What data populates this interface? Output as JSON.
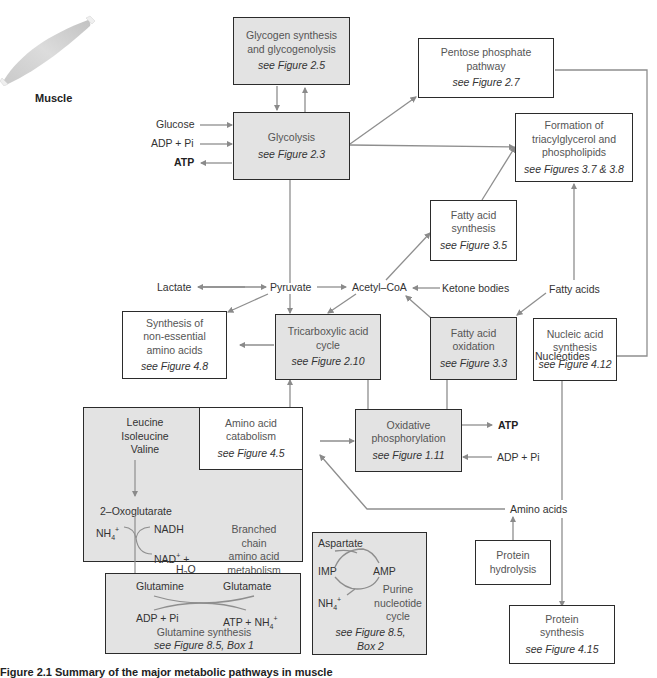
{
  "organ": {
    "label": "Muscle"
  },
  "boxes": {
    "glycogen": {
      "line1": "Glycogen synthesis",
      "line2": "and glycogenolysis",
      "ref": "see Figure 2.5"
    },
    "pentose": {
      "line1": "Pentose phosphate",
      "line2": "pathway",
      "ref": "see Figure 2.7"
    },
    "glycolysis": {
      "line1": "Glycolysis",
      "ref": "see Figure 2.3"
    },
    "tag_formation": {
      "line1": "Formation of",
      "line2": "triacylglycerol and",
      "line3": "phospholipids",
      "ref": "see Figures 3.7 & 3.8"
    },
    "fa_synthesis": {
      "line1": "Fatty acid",
      "line2": "synthesis",
      "ref": "see Figure 3.5"
    },
    "nonessential_aa": {
      "line1": "Synthesis of",
      "line2": "non-essential",
      "line3": "amino acids",
      "ref": "see Figure 4.8"
    },
    "tca": {
      "line1": "Tricarboxylic acid",
      "line2": "cycle",
      "ref": "see Figure 2.10"
    },
    "fa_oxidation": {
      "line1": "Fatty acid",
      "line2": "oxidation",
      "ref": "see Figure 3.3"
    },
    "nucleic_acid": {
      "line1": "Nucleic acid",
      "line2": "synthesis",
      "ref": "see Figure 4.12"
    },
    "aa_catabolism": {
      "line1": "Amino acid",
      "line2": "catabolism",
      "ref": "see Figure 4.5"
    },
    "oxphos": {
      "line1": "Oxidative",
      "line2": "phosphorylation",
      "ref": "see Figure 1.11"
    },
    "protein_hydrolysis": {
      "line1": "Protein",
      "line2": "hydrolysis"
    },
    "protein_synthesis": {
      "line1": "Protein",
      "line2": "synthesis",
      "ref": "see Figure 4.15"
    },
    "bcaa": {
      "aa1": "Leucine",
      "aa2": "Isoleucine",
      "aa3": "Valine",
      "oxo": "2–Oxoglutarate",
      "nh4": "NH",
      "nadh": "NADH",
      "nad": "NAD",
      "plus": "+",
      "h2o_h": "H",
      "h2o_o": "O",
      "glutamate": "Glutamate",
      "title1": "Branched",
      "title2": "chain",
      "title3": "amino acid",
      "title4": "metabolism",
      "ref": "see Figure 8.5"
    },
    "glutamine": {
      "glutamine": "Glutamine",
      "glutamate": "Glutamate",
      "adp": "ADP + Pi",
      "atp": "ATP + NH",
      "title": "Glutamine synthesis",
      "ref": "see Figure 8.5, Box 1"
    },
    "purine": {
      "aspartate": "Aspartate",
      "imp": "IMP",
      "amp": "AMP",
      "nh4": "NH",
      "title1": "Purine",
      "title2": "nucleotide",
      "title3": "cycle",
      "ref1": "see Figure 8.5,",
      "ref2": "Box 2"
    }
  },
  "labels": {
    "glucose": "Glucose",
    "adp_pi_top": "ADP + Pi",
    "atp_top": "ATP",
    "lactate": "Lactate",
    "pyruvate": "Pyruvate",
    "acetyl_coa": "Acetyl–CoA",
    "ketone_bodies": "Ketone bodies",
    "fatty_acids": "Fatty acids",
    "nucleotides": "Nucleotides",
    "atp_right": "ATP",
    "adp_pi_right": "ADP + Pi",
    "amino_acids": "Amino acids"
  },
  "caption": "Figure 2.1  Summary of the major metabolic pathways in muscle"
}
